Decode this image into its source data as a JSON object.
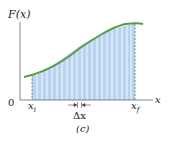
{
  "figure": {
    "y_label": "F(x)",
    "x_label": "x",
    "origin_label": "0",
    "xi_label": "x",
    "xi_sub": "i",
    "xf_label": "x",
    "xf_sub": "f",
    "dx_label": "Δx",
    "caption": "(c)",
    "colors": {
      "curve": "#5a9a4a",
      "fill": "#b8d4f0",
      "axis": "#666666",
      "strip": "#ffffff"
    }
  }
}
